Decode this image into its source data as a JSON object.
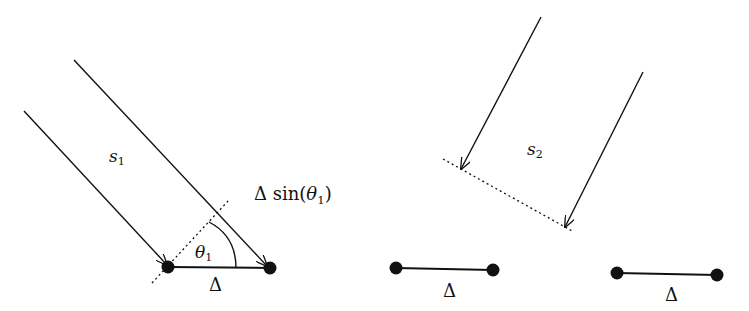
{
  "figure": {
    "left_panel": {
      "signal_label": "s",
      "signal_sub": "1",
      "angle_label": "θ",
      "angle_sub": "1",
      "path_diff_label_prefix": "Δ sin(",
      "path_diff_theta": "θ",
      "path_diff_sub": "1",
      "path_diff_suffix": ")",
      "baseline_label": "Δ"
    },
    "right_panel": {
      "signal_label": "s",
      "signal_sub": "2",
      "baseline_label_a": "Δ",
      "baseline_label_b": "Δ"
    },
    "colors": {
      "ink": "#111111",
      "background": "#ffffff"
    }
  }
}
